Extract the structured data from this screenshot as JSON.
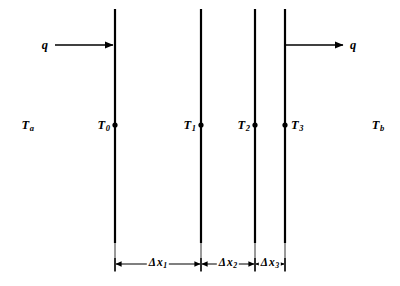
{
  "figure": {
    "background_color": "#ffffff",
    "line_color": "#000000"
  },
  "heat_flux": {
    "inlet": {
      "label": "q",
      "direction": "right",
      "description": "heat flux entering the composite wall"
    },
    "outlet": {
      "label": "q",
      "direction": "right",
      "description": "heat flux leaving the composite wall"
    }
  },
  "temperatures": [
    {
      "name": "T-a",
      "base": "T",
      "sub": "a",
      "side": "left",
      "x": 27,
      "y": 125,
      "has_marker": false
    },
    {
      "name": "T-0",
      "base": "T",
      "sub": "0",
      "side": "left",
      "x": 110,
      "y": 125,
      "has_marker": true
    },
    {
      "name": "T-1",
      "base": "T",
      "sub": "1",
      "side": "left",
      "x": 196,
      "y": 125,
      "has_marker": true
    },
    {
      "name": "T-2",
      "base": "T",
      "sub": "2",
      "side": "left",
      "x": 250,
      "y": 125,
      "has_marker": true
    },
    {
      "name": "T-3",
      "base": "T",
      "sub": "3",
      "side": "right",
      "x": 291,
      "y": 125,
      "has_marker": true
    },
    {
      "name": "T-b",
      "base": "T",
      "sub": "b",
      "side": "left",
      "x": 378,
      "y": 125,
      "has_marker": false
    }
  ],
  "wall_interfaces": [
    {
      "name": "interface-0",
      "x": 115
    },
    {
      "name": "interface-1",
      "x": 201
    },
    {
      "name": "interface-2",
      "x": 255
    },
    {
      "name": "interface-3",
      "x": 285
    }
  ],
  "dimensions": [
    {
      "name": "dx1",
      "delta": "Δ",
      "base": "x",
      "sub": "1",
      "from_x": 115,
      "to_x": 201,
      "label_x": 158
    },
    {
      "name": "dx2",
      "delta": "Δ",
      "base": "x",
      "sub": "2",
      "from_x": 201,
      "to_x": 255,
      "label_x": 228
    },
    {
      "name": "dx3",
      "delta": "Δ",
      "base": "x",
      "sub": "3",
      "from_x": 255,
      "to_x": 285,
      "label_x": 270
    }
  ],
  "geometry": {
    "wall_top_y": 9,
    "wall_bottom_y": 243,
    "flux_arrow_y": 45,
    "inlet_arrow_start_x": 55,
    "outlet_arrow_end_x": 345,
    "dim_line_y": 264,
    "marker_y": 125
  }
}
